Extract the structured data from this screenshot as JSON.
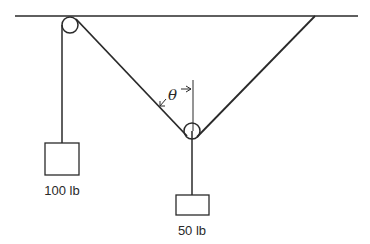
{
  "diagram": {
    "angle_label": "θ",
    "weights": [
      {
        "id": "left",
        "label": "100 lb"
      },
      {
        "id": "center",
        "label": "50 lb"
      }
    ],
    "colors": {
      "line": "#2a2a2a",
      "background": "#ffffff"
    }
  }
}
